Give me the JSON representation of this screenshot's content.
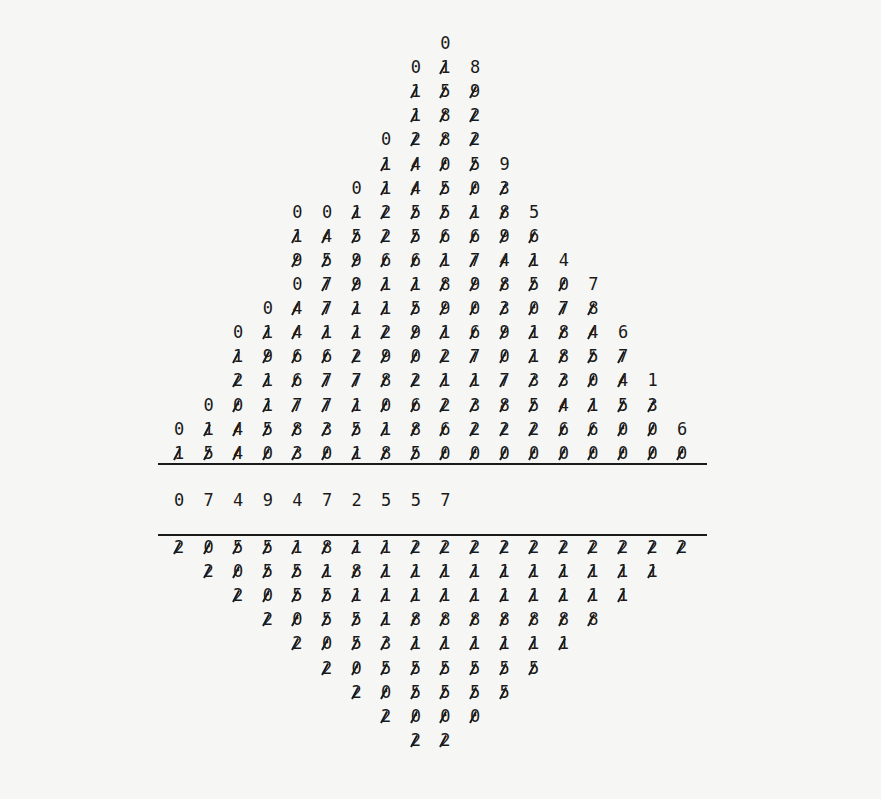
{
  "layout": {
    "col0_x": 179,
    "col_step": 29.6,
    "top_first_y": 43,
    "row_step": 24.1,
    "rule_top_y": 463,
    "quotient_y": 500,
    "rule_bottom_y": 534,
    "bottom_first_y": 547,
    "rule_x_start": 158,
    "rule_x_end": 707
  },
  "dividend_section": {
    "rows": [
      {
        "col": 9,
        "digits": "0",
        "uncrossed": [
          0
        ]
      },
      {
        "col": 8,
        "digits": "018",
        "uncrossed": [
          0,
          2
        ]
      },
      {
        "col": 8,
        "digits": "159",
        "uncrossed": []
      },
      {
        "col": 8,
        "digits": "182",
        "uncrossed": []
      },
      {
        "col": 7,
        "digits": "0282",
        "uncrossed": [
          0
        ]
      },
      {
        "col": 7,
        "digits": "14059",
        "uncrossed": [
          4
        ]
      },
      {
        "col": 6,
        "digits": "014503",
        "uncrossed": [
          0
        ]
      },
      {
        "col": 4,
        "digits": "001255185",
        "uncrossed": [
          0,
          1,
          8
        ]
      },
      {
        "col": 4,
        "digits": "145256696",
        "uncrossed": []
      },
      {
        "col": 4,
        "digits": "9596617414",
        "uncrossed": [
          9
        ]
      },
      {
        "col": 4,
        "digits": "07911898507",
        "uncrossed": [
          0,
          10
        ]
      },
      {
        "col": 3,
        "digits": "047115903078",
        "uncrossed": [
          0
        ]
      },
      {
        "col": 2,
        "digits": "01411291691846",
        "uncrossed": [
          0,
          13
        ]
      },
      {
        "col": 2,
        "digits": "19662902701857",
        "uncrossed": []
      },
      {
        "col": 2,
        "digits": "216778211733041",
        "uncrossed": [
          14
        ]
      },
      {
        "col": 1,
        "digits": "0017710623854153",
        "uncrossed": [
          0
        ]
      },
      {
        "col": 0,
        "digits": "014583518622266006",
        "uncrossed": [
          0,
          17
        ]
      },
      {
        "col": 0,
        "digits": "154030185000000000",
        "uncrossed": []
      }
    ]
  },
  "quotient": {
    "col": 0,
    "digits": "0749472557",
    "text": "0 7 4 9 4 7 2 5 5 7"
  },
  "divisor_section": {
    "rows": [
      {
        "col": 0,
        "digits": "205518112222222222",
        "uncrossed": []
      },
      {
        "col": 1,
        "digits": "2055181111111111",
        "uncrossed": []
      },
      {
        "col": 2,
        "digits": "20551111111111",
        "uncrossed": []
      },
      {
        "col": 3,
        "digits": "205518888888",
        "uncrossed": []
      },
      {
        "col": 4,
        "digits": "2053111111",
        "uncrossed": []
      },
      {
        "col": 5,
        "digits": "20555555",
        "uncrossed": []
      },
      {
        "col": 6,
        "digits": "205555",
        "uncrossed": []
      },
      {
        "col": 7,
        "digits": "2000",
        "uncrossed": []
      },
      {
        "col": 8,
        "digits": "22",
        "uncrossed": []
      }
    ]
  },
  "colors": {
    "ink": "#1a1a1a",
    "paper": "#f6f6f4"
  }
}
